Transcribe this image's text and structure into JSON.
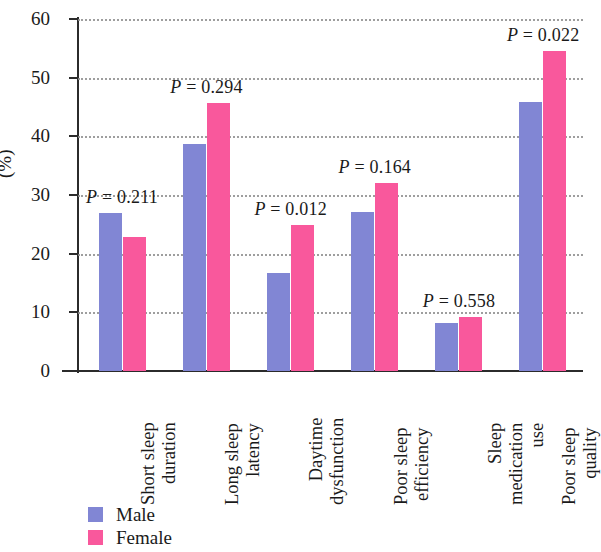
{
  "chart_data": {
    "type": "bar",
    "title": "",
    "subtitle": "",
    "xlabel": "",
    "ylabel": "(%)",
    "ylim": [
      0,
      60
    ],
    "yticks": [
      0,
      10,
      20,
      30,
      40,
      50,
      60
    ],
    "ytick_labels": [
      "0",
      "10",
      "20",
      "30",
      "40",
      "50",
      "60"
    ],
    "grid": "horizontal-dotted",
    "legend_position": "bottom-left",
    "categories": [
      "Short sleep duration",
      "Long sleep latency",
      "Daytime dysfunction",
      "Poor sleep efficiency",
      "Sleep medication use",
      "Poor sleep quality"
    ],
    "category_lines": [
      [
        "Short sleep",
        "duration"
      ],
      [
        "Long sleep",
        "latency"
      ],
      [
        "Daytime",
        "dysfunction"
      ],
      [
        "Poor sleep",
        "efficiency"
      ],
      [
        "Sleep",
        "medication",
        "use"
      ],
      [
        "Poor sleep",
        "quality"
      ]
    ],
    "series": [
      {
        "name": "Male",
        "color": "#8186d4",
        "values": [
          26.9,
          38.7,
          16.7,
          27.1,
          8.2,
          45.8
        ]
      },
      {
        "name": "Female",
        "color": "#f9589c",
        "values": [
          22.8,
          45.6,
          24.9,
          32.0,
          9.2,
          54.5
        ]
      }
    ],
    "annotations": [
      {
        "text": "P = 0.211",
        "symbol": "P",
        "value": "0.211",
        "category": "Short sleep duration"
      },
      {
        "text": "P = 0.294",
        "symbol": "P",
        "value": "0.294",
        "category": "Long sleep latency"
      },
      {
        "text": "P = 0.012",
        "symbol": "P",
        "value": "0.012",
        "category": "Daytime dysfunction"
      },
      {
        "text": "P = 0.164",
        "symbol": "P",
        "value": "0.164",
        "category": "Poor sleep efficiency"
      },
      {
        "text": "P = 0.558",
        "symbol": "P",
        "value": "0.558",
        "category": "Sleep medication use"
      },
      {
        "text": "P = 0.022",
        "symbol": "P",
        "value": "0.022",
        "category": "Poor sleep quality"
      }
    ]
  },
  "legend": {
    "items": [
      {
        "label": "Male",
        "color": "#8186d4"
      },
      {
        "label": "Female",
        "color": "#f9589c"
      }
    ]
  },
  "colors": {
    "male": "#8186d4",
    "female": "#f9589c",
    "axis": "#2b2b2b",
    "grid": "#8e8e8e",
    "text": "#1a1a1a"
  }
}
